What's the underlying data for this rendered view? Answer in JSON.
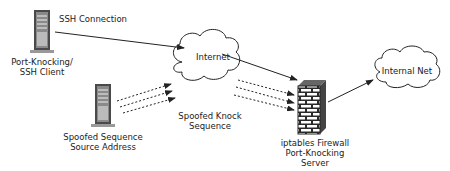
{
  "nodes": {
    "client": {
      "label_line1": "Port-Knocking/",
      "label_line2": "SSH Client",
      "icon": "server-tower-icon"
    },
    "spoofer": {
      "label_line1": "Spoofed Sequence",
      "label_line2": "Source Address",
      "icon": "server-tower-icon"
    },
    "internet": {
      "label": "Internet",
      "icon": "cloud-icon"
    },
    "firewall": {
      "label_line1": "iptables Firewall",
      "label_line2": "Port-Knocking",
      "label_line3": "Server",
      "icon": "brick-firewall-icon"
    },
    "internal": {
      "label": "Internal Net",
      "icon": "cloud-icon"
    }
  },
  "edges": {
    "ssh": {
      "label": "SSH Connection",
      "style": "solid"
    },
    "spoofed": {
      "label_line1": "Spoofed Knock",
      "label_line2": "Sequence",
      "style": "dotted"
    }
  },
  "colors": {
    "line": "#222222",
    "server_body": "#555555",
    "brick": "#333333"
  }
}
